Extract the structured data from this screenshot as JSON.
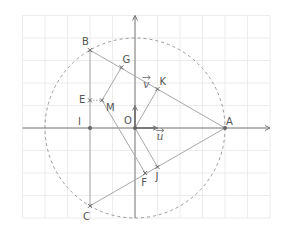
{
  "figure": {
    "origin_px": [
      135,
      128
    ],
    "unit_px": 22.5,
    "grid": {
      "x_min": -5,
      "x_max": 6,
      "y_min": -4,
      "y_max": 5,
      "color": "#ececec"
    },
    "axes_color": "#7a7a7a",
    "segment_color": "#a8a8a8",
    "circle": {
      "center": "O",
      "radius": 4,
      "style": "dashed",
      "color": "#9a9a9a"
    },
    "vectors": [
      {
        "name": "u",
        "label": "u",
        "from": [
          0,
          0
        ],
        "to": [
          1,
          0
        ],
        "label_pos": [
          0.95,
          -0.55
        ]
      },
      {
        "name": "v",
        "label": "v",
        "from": [
          0,
          0
        ],
        "to": [
          0,
          1
        ],
        "label_pos": [
          0.35,
          1.8
        ]
      }
    ],
    "points": [
      {
        "name": "O",
        "label": "O",
        "x": 0,
        "y": 0,
        "label_dx": -11,
        "label_dy": -4
      },
      {
        "name": "A",
        "label": "A",
        "x": 4,
        "y": 0,
        "label_dx": 1,
        "label_dy": -3
      },
      {
        "name": "B",
        "label": "B",
        "x": -2,
        "y": 3.46,
        "label_dx": -8,
        "label_dy": -5
      },
      {
        "name": "C",
        "label": "C",
        "x": -2,
        "y": -3.46,
        "label_dx": -7,
        "label_dy": 14
      },
      {
        "name": "I",
        "label": "I",
        "x": -2,
        "y": 0,
        "label_dx": -12,
        "label_dy": -3
      },
      {
        "name": "E",
        "label": "E",
        "x": -2,
        "y": 1.23,
        "label_dx": -11,
        "label_dy": 3
      },
      {
        "name": "M",
        "label": "M",
        "x": -1.47,
        "y": 1.23,
        "label_dx": 4,
        "label_dy": 11
      },
      {
        "name": "G",
        "label": "G",
        "x": -0.6,
        "y": 2.7,
        "label_dx": 1,
        "label_dy": -4
      },
      {
        "name": "K",
        "label": "K",
        "x": 1,
        "y": 1.73,
        "label_dx": 2,
        "label_dy": -4
      },
      {
        "name": "F",
        "label": "F",
        "x": 0.45,
        "y": -2,
        "label_dx": -4,
        "label_dy": 13
      },
      {
        "name": "J",
        "label": "J",
        "x": 1,
        "y": -1.73,
        "label_dx": -2,
        "label_dy": 13
      }
    ],
    "segments": [
      [
        "A",
        "B"
      ],
      [
        "A",
        "C"
      ],
      [
        "B",
        "C"
      ],
      [
        "O",
        "K"
      ],
      [
        "O",
        "J"
      ],
      [
        "M",
        "G"
      ],
      [
        "M",
        "F"
      ]
    ],
    "dotted_segments": [
      [
        "E",
        "M"
      ]
    ]
  }
}
